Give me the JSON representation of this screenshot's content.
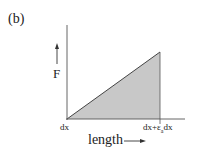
{
  "panel_label": "(b)",
  "y_axis": {
    "label": "F"
  },
  "x_axis": {
    "label": "length",
    "ticks": [
      {
        "label": "dx"
      },
      {
        "label_main": "dx+ε",
        "label_sub": "a",
        "label_tail": "dx"
      }
    ]
  },
  "shaded_region": {
    "shape": "triangle",
    "fill": "#c8c8c8",
    "stroke": "#444444"
  },
  "colors": {
    "axis": "#555555",
    "fill": "#c8c8c8",
    "text": "#222222"
  }
}
